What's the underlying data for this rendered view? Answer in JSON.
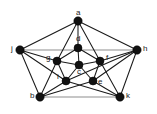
{
  "figure": {
    "title": "",
    "background_color": "#ffffff",
    "width": 157,
    "height": 114
  },
  "chart_data": {
    "type": "diagram",
    "diagram_kind": "undirected-graph",
    "title": "",
    "node_color": "#111111",
    "edge_color": "#1a1a1a",
    "faint_edge_color": "#8d8d8d",
    "nodes": [
      {
        "id": "a",
        "label": "a",
        "x": 78,
        "y": 21,
        "label_dx": -2,
        "label_dy": -12,
        "radius": 4.2
      },
      {
        "id": "j",
        "label": "j",
        "x": 20,
        "y": 50,
        "label_dx": -9,
        "label_dy": -5,
        "radius": 4.2
      },
      {
        "id": "h",
        "label": "h",
        "x": 137,
        "y": 50,
        "label_dx": 6,
        "label_dy": -5,
        "radius": 4.2
      },
      {
        "id": "b",
        "label": "b",
        "x": 40,
        "y": 97,
        "label_dx": -10,
        "label_dy": -5,
        "radius": 4.2
      },
      {
        "id": "k",
        "label": "k",
        "x": 120,
        "y": 97,
        "label_dx": 6,
        "label_dy": -5,
        "radius": 4.2
      },
      {
        "id": "d",
        "label": "d",
        "x": 78,
        "y": 48,
        "label_dx": -2,
        "label_dy": -13,
        "radius": 4.0
      },
      {
        "id": "g",
        "label": "g",
        "x": 57,
        "y": 61,
        "label_dx": -11,
        "label_dy": -7,
        "radius": 4.0
      },
      {
        "id": "f",
        "label": "f",
        "x": 100,
        "y": 61,
        "label_dx": 6,
        "label_dy": -7,
        "radius": 4.0
      },
      {
        "id": "i",
        "label": "i",
        "x": 66,
        "y": 81,
        "label_dx": -9,
        "label_dy": -8,
        "radius": 4.0
      },
      {
        "id": "e",
        "label": "e",
        "x": 93,
        "y": 81,
        "label_dx": 5,
        "label_dy": -3,
        "radius": 4.0
      },
      {
        "id": "c",
        "label": "c",
        "x": 79,
        "y": 65,
        "label_dx": -2,
        "label_dy": 3,
        "radius": 4.0
      }
    ],
    "edges": [
      {
        "from": "a",
        "to": "j",
        "style": "solid"
      },
      {
        "from": "a",
        "to": "h",
        "style": "solid"
      },
      {
        "from": "j",
        "to": "b",
        "style": "solid"
      },
      {
        "from": "h",
        "to": "k",
        "style": "solid"
      },
      {
        "from": "b",
        "to": "k",
        "style": "faint"
      },
      {
        "from": "j",
        "to": "h",
        "style": "faint"
      },
      {
        "from": "a",
        "to": "g",
        "style": "solid"
      },
      {
        "from": "a",
        "to": "f",
        "style": "solid"
      },
      {
        "from": "a",
        "to": "d",
        "style": "solid"
      },
      {
        "from": "j",
        "to": "g",
        "style": "solid"
      },
      {
        "from": "j",
        "to": "i",
        "style": "solid"
      },
      {
        "from": "h",
        "to": "f",
        "style": "solid"
      },
      {
        "from": "h",
        "to": "e",
        "style": "solid"
      },
      {
        "from": "h",
        "to": "i",
        "style": "solid"
      },
      {
        "from": "b",
        "to": "g",
        "style": "solid"
      },
      {
        "from": "b",
        "to": "i",
        "style": "solid"
      },
      {
        "from": "b",
        "to": "e",
        "style": "solid"
      },
      {
        "from": "k",
        "to": "e",
        "style": "solid"
      },
      {
        "from": "k",
        "to": "i",
        "style": "solid"
      },
      {
        "from": "k",
        "to": "f",
        "style": "solid"
      },
      {
        "from": "d",
        "to": "g",
        "style": "solid"
      },
      {
        "from": "d",
        "to": "f",
        "style": "solid"
      },
      {
        "from": "d",
        "to": "c",
        "style": "solid"
      },
      {
        "from": "g",
        "to": "c",
        "style": "solid"
      },
      {
        "from": "f",
        "to": "c",
        "style": "solid"
      },
      {
        "from": "i",
        "to": "c",
        "style": "solid"
      },
      {
        "from": "e",
        "to": "c",
        "style": "solid"
      },
      {
        "from": "g",
        "to": "i",
        "style": "solid"
      },
      {
        "from": "f",
        "to": "e",
        "style": "solid"
      }
    ]
  }
}
